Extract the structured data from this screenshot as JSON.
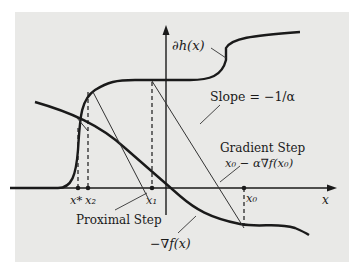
{
  "diagram": {
    "axes": {
      "x_label": "x"
    },
    "labels": {
      "subgradient": "∂h(x)",
      "slope": "Slope = −1/α",
      "gradient_step_title": "Gradient Step",
      "gradient_step_formula": "x₀ − α∇f(x₀)",
      "proximal_step": "Proximal Step",
      "neg_gradient": "−∇f(x)"
    },
    "points": {
      "x_star": "x*",
      "x2": "x₂",
      "x1": "x₁",
      "x0": "x₀"
    }
  }
}
